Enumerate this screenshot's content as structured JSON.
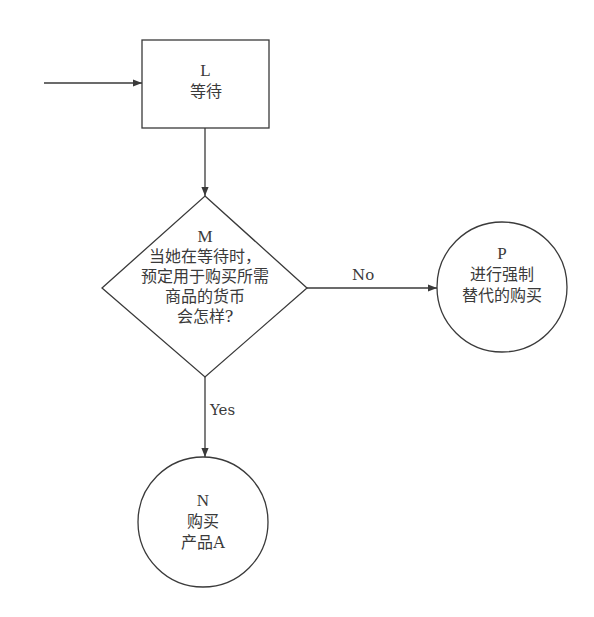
{
  "diagram": {
    "type": "flowchart",
    "colors": {
      "stroke": "#3a3a3a",
      "text": "#3a3a3a",
      "background": "#ffffff"
    },
    "nodes": {
      "L": {
        "id": "L",
        "shape": "rectangle",
        "lines": [
          "等待"
        ]
      },
      "M": {
        "id": "M",
        "shape": "diamond",
        "lines": [
          "当她在等待时，",
          "预定用于购买所需",
          "商品的货币",
          "会怎样?"
        ]
      },
      "P": {
        "id": "P",
        "shape": "circle",
        "lines": [
          "进行强制",
          "替代的购买"
        ]
      },
      "N": {
        "id": "N",
        "shape": "circle",
        "lines": [
          "购买",
          "产品A"
        ]
      }
    },
    "edges": {
      "incoming": {
        "from": "",
        "to": "L",
        "label": ""
      },
      "L_to_M": {
        "from": "L",
        "to": "M",
        "label": ""
      },
      "M_to_P": {
        "from": "M",
        "to": "P",
        "label": "No"
      },
      "M_to_N": {
        "from": "M",
        "to": "N",
        "label": "Yes"
      }
    }
  }
}
